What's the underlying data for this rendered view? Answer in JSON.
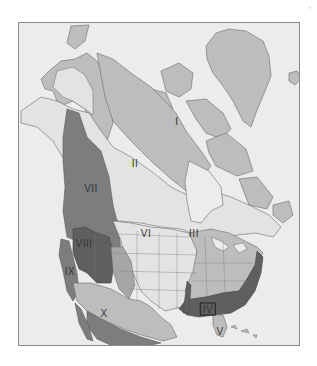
{
  "map": {
    "title": "",
    "corner_mark": ", ",
    "colors": {
      "ocean": "#ececec",
      "border": "#8a8a8a",
      "region_light": "#e3e3e3",
      "region_pale": "#d4d4d4",
      "region_mid": "#bdbdbd",
      "region_midDark": "#a6a6a6",
      "region_dark": "#7d7d7d",
      "region_darker": "#5f5f5f",
      "outline": "#6a6a6a"
    },
    "regions": [
      {
        "id": "I",
        "label": "I",
        "name": "region-1"
      },
      {
        "id": "II",
        "label": "II",
        "name": "region-2"
      },
      {
        "id": "III",
        "label": "III",
        "name": "region-3"
      },
      {
        "id": "IV",
        "label": "IV",
        "name": "region-4"
      },
      {
        "id": "V",
        "label": "V",
        "name": "region-5"
      },
      {
        "id": "VI",
        "label": "VI",
        "name": "region-6"
      },
      {
        "id": "VII",
        "label": "VII",
        "name": "region-7"
      },
      {
        "id": "VIII",
        "label": "VIII",
        "name": "region-8"
      },
      {
        "id": "IX",
        "label": "IX",
        "name": "region-9"
      },
      {
        "id": "X",
        "label": "X",
        "name": "region-10"
      }
    ]
  }
}
